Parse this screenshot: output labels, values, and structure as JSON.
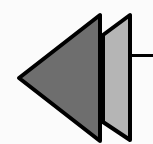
{
  "icon": {
    "name": "rewind-icon",
    "colors": {
      "background": "#fbfbfb",
      "dark_triangle": "#6e6e6e",
      "light_triangle": "#b5b5b5",
      "stroke": "#000000"
    }
  }
}
